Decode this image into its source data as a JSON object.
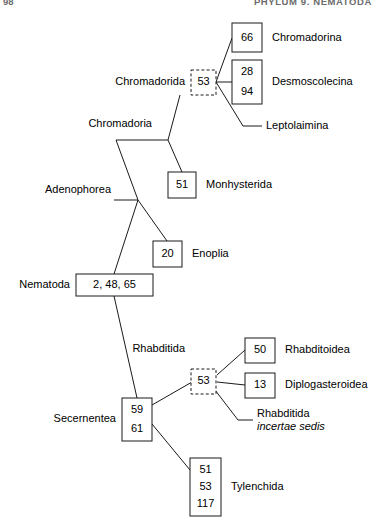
{
  "page": {
    "running_head_left": "98",
    "running_head_right": "PHYLUM 9. NEMATODA",
    "figure_type": "cladogram"
  },
  "nodes": {
    "nematoda": {
      "label": "Nematoda",
      "value": "2, 48, 65",
      "box": "solid"
    },
    "adenophorea": {
      "label": "Adenophorea",
      "value": "",
      "box": "none"
    },
    "chromadoria": {
      "label": "Chromadoria",
      "value": "",
      "box": "none"
    },
    "chromadorida": {
      "label": "Chromadorida",
      "value": "53",
      "box": "dashed"
    },
    "secernentea": {
      "label": "Secernentea",
      "value": "59\n61",
      "box": "solid"
    },
    "rhabditida": {
      "label": "Rhabditida",
      "value": "53",
      "box": "dashed"
    }
  },
  "leaves": {
    "chromadorina": {
      "label": "Chromadorina",
      "value": "66",
      "box": "solid"
    },
    "desmoscolecina": {
      "label": "Desmoscolecina",
      "value": "28\n94",
      "box": "solid"
    },
    "leptolaimina": {
      "label": "Leptolaimina",
      "value": "",
      "box": "none"
    },
    "monhysterida": {
      "label": "Monhysterida",
      "value": "51",
      "box": "solid"
    },
    "enoplia": {
      "label": "Enoplia",
      "value": "20",
      "box": "solid"
    },
    "rhabditoidea": {
      "label": "Rhabditoidea",
      "value": "50",
      "box": "solid"
    },
    "diplogasteroidea": {
      "label": "Diplogasteroidea",
      "value": "13",
      "box": "solid"
    },
    "rhabditida_is": {
      "label": "Rhabditida",
      "label2": "incertae sedis",
      "value": "",
      "box": "none"
    },
    "tylenchida": {
      "label": "Tylenchida",
      "value": "51\n53\n117",
      "box": "solid"
    }
  },
  "box_values": {
    "chromadorina": [
      "66"
    ],
    "desmoscolecina": [
      "28",
      "94"
    ],
    "chromadorida": [
      "53"
    ],
    "monhysterida": [
      "51"
    ],
    "enoplia": [
      "20"
    ],
    "nematoda": [
      "2, 48, 65"
    ],
    "rhabditida": [
      "53"
    ],
    "rhabditoidea": [
      "50"
    ],
    "diplogasteroidea": [
      "13"
    ],
    "secernentea": [
      "59",
      "61"
    ],
    "tylenchida": [
      "51",
      "53",
      "117"
    ]
  },
  "colors": {
    "stroke": "#1a1a1a",
    "text": "#000000",
    "background": "#ffffff",
    "running_head": "#6c6c6c"
  }
}
